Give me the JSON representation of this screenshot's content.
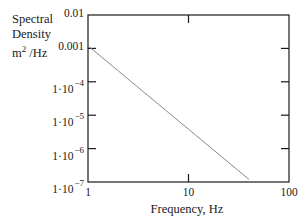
{
  "chart_data": {
    "type": "line",
    "title": "",
    "xlabel": "Frequency, Hz",
    "ylabel_lines": [
      "Spectral",
      "Density",
      "m2/Hz"
    ],
    "ylabel": "Spectral Density m²/Hz",
    "xscale": "log",
    "yscale": "log",
    "xlim": [
      1,
      100
    ],
    "ylim": [
      1e-07,
      0.01
    ],
    "grid": false,
    "legend": null,
    "x_ticks": [
      {
        "value": 1,
        "label": "1"
      },
      {
        "value": 10,
        "label": "10"
      },
      {
        "value": 100,
        "label": "100"
      }
    ],
    "y_ticks": [
      {
        "value": 0.01,
        "label": "0.01",
        "mantissa": "0.01",
        "exp": ""
      },
      {
        "value": 0.001,
        "label": "0.001",
        "mantissa": "0.001",
        "exp": ""
      },
      {
        "value": 0.0001,
        "label": "1·10^-4",
        "mantissa": "1·10",
        "exp": "−4"
      },
      {
        "value": 1e-05,
        "label": "1·10^-5",
        "mantissa": "1·10",
        "exp": "−5"
      },
      {
        "value": 1e-06,
        "label": "1·10^-6",
        "mantissa": "1·10",
        "exp": "−6"
      },
      {
        "value": 1e-07,
        "label": "1·10^-7",
        "mantissa": "1·10",
        "exp": "−7"
      }
    ],
    "series": [
      {
        "name": "Spectral density",
        "color": "#8a8a8a",
        "x": [
          1,
          2,
          5,
          10,
          20,
          40
        ],
        "y": [
          0.0012,
          0.000212,
          2.15e-05,
          3.8e-06,
          6.7e-07,
          1.2e-07
        ]
      }
    ]
  },
  "ylabel": {
    "line1": "Spectral",
    "line2": "Density",
    "line3_base": "m",
    "line3_sup": "2",
    "line3_rest": " /Hz"
  },
  "colors": {
    "axis": "#1a1a1a",
    "line": "#8a8a8a",
    "background": "#ffffff"
  }
}
